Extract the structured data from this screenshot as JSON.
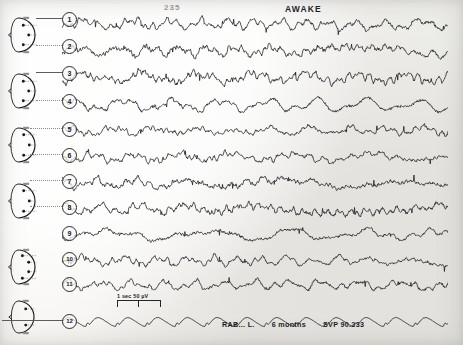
{
  "header": {
    "page_number": "235",
    "state_label": "AWAKE"
  },
  "caption": {
    "subject": "RAB... L.",
    "age": "6 months",
    "record_id": "SVP 90.233"
  },
  "calibration": {
    "label": "1 sec   50 µV"
  },
  "channels": [
    {
      "number": "1",
      "label": "1"
    },
    {
      "number": "2",
      "label": "2"
    },
    {
      "number": "3",
      "label": "3"
    },
    {
      "number": "4",
      "label": "4"
    },
    {
      "number": "5",
      "label": "5"
    },
    {
      "number": "6",
      "label": "6"
    },
    {
      "number": "7",
      "label": "7"
    },
    {
      "number": "8",
      "label": "8"
    },
    {
      "number": "9",
      "label": "9"
    },
    {
      "number": "10",
      "label": "10"
    },
    {
      "number": "11",
      "label": "11"
    },
    {
      "number": "12",
      "label": "12"
    }
  ],
  "montages": [
    {
      "name": "montage-head-1",
      "electrodes": 3,
      "orientation": "right"
    },
    {
      "name": "montage-head-2",
      "electrodes": 3,
      "orientation": "right"
    },
    {
      "name": "montage-head-3",
      "electrodes": 3,
      "orientation": "left"
    },
    {
      "name": "montage-head-4",
      "electrodes": 3,
      "orientation": "left"
    },
    {
      "name": "montage-head-5",
      "electrodes": 4,
      "orientation": "midline"
    },
    {
      "name": "montage-head-6",
      "electrodes": 2,
      "orientation": "midline"
    }
  ],
  "chart_data": {
    "type": "line",
    "title": "AWAKE",
    "xlabel": "",
    "ylabel": "",
    "grid": false,
    "legend_position": "none",
    "x_range": [
      0,
      386
    ],
    "series": [
      {
        "name": "1",
        "baseline": 24,
        "amplitude": 9,
        "character": "mixed-fast"
      },
      {
        "name": "2",
        "baseline": 51,
        "amplitude": 9,
        "character": "mixed-fast"
      },
      {
        "name": "3",
        "baseline": 78,
        "amplitude": 10,
        "character": "mixed-fast"
      },
      {
        "name": "4",
        "baseline": 105,
        "amplitude": 9,
        "character": "mixed-slow"
      },
      {
        "name": "5",
        "baseline": 131,
        "amplitude": 8,
        "character": "mixed-fast"
      },
      {
        "name": "6",
        "baseline": 157,
        "amplitude": 8,
        "character": "mixed-fast"
      },
      {
        "name": "7",
        "baseline": 183,
        "amplitude": 9,
        "character": "mixed-fast"
      },
      {
        "name": "8",
        "baseline": 209,
        "amplitude": 9,
        "character": "mixed-fast"
      },
      {
        "name": "9",
        "baseline": 235,
        "amplitude": 8,
        "character": "mixed-slow"
      },
      {
        "name": "10",
        "baseline": 261,
        "amplitude": 8,
        "character": "mixed-fast"
      },
      {
        "name": "11",
        "baseline": 285,
        "amplitude": 8,
        "character": "mixed-fast"
      },
      {
        "name": "12",
        "baseline": 322,
        "amplitude": 5,
        "character": "regular-slow"
      }
    ]
  },
  "colors": {
    "ink": "#1b1b1d",
    "paper": "#f4f3f1",
    "faint_ink": "#9b9a96"
  }
}
